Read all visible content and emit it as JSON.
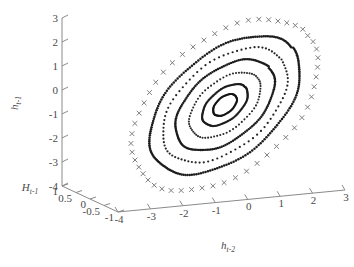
{
  "figure": {
    "kind": "3d-scatter-phase-portrait",
    "background": "#ffffff",
    "width": 354,
    "height": 267
  },
  "chart_data": {
    "type": "scatter",
    "title": "",
    "projection": "3d",
    "xlabel": "h_{t-2}",
    "ylabel": "h_{t-1}",
    "zlabel": "H_{t-1}",
    "xlabel_plain": "h",
    "xlabel_sub": "t-2",
    "ylabel_plain": "h",
    "ylabel_sub": "t-1",
    "zlabel_plain": "H",
    "zlabel_sub": "t-1",
    "grid": false,
    "legend": null,
    "xlim": [
      -4,
      3
    ],
    "ylim": [
      -4,
      3
    ],
    "zlim": [
      -1,
      1
    ],
    "xticks": [
      "-4",
      "-3",
      "-2",
      "-1",
      "0",
      "1",
      "2",
      "3"
    ],
    "xtick_values": [
      -4,
      -3,
      -2,
      -1,
      0,
      1,
      2,
      3
    ],
    "yticks": [
      "3",
      "2",
      "1",
      "0",
      "-1",
      "-2",
      "-3",
      "-4"
    ],
    "ytick_values": [
      3,
      2,
      1,
      0,
      -1,
      -2,
      -3,
      -4
    ],
    "zticks": [
      "1",
      "0.5",
      "0",
      "-0.5",
      "-1"
    ],
    "ztick_values": [
      1,
      0.5,
      0,
      -0.5,
      -1
    ],
    "center_px": [
      225,
      105
    ],
    "tilt_deg": -40,
    "series": [
      {
        "name": "outer-cross-orbit",
        "marker": "x",
        "color": "#7d7d7d",
        "marker_px": 4.2,
        "stroke_px": 1.0,
        "n_points": 52,
        "rx_px": 108,
        "ry_px": 66,
        "phase_deg": 0
      },
      {
        "name": "ring-1-dense",
        "marker": "dot",
        "color": "#1c1c1c",
        "marker_px": 2.5,
        "n_points": 200,
        "rx_px": 88,
        "ry_px": 52,
        "phase_deg": 0
      },
      {
        "name": "ring-2-dotted",
        "marker": "dot",
        "color": "#242424",
        "marker_px": 2.2,
        "n_points": 86,
        "rx_px": 73,
        "ry_px": 43,
        "phase_deg": 2
      },
      {
        "name": "ring-3-dense",
        "marker": "dot",
        "color": "#1c1c1c",
        "marker_px": 2.4,
        "n_points": 165,
        "rx_px": 58,
        "ry_px": 34,
        "phase_deg": 0
      },
      {
        "name": "ring-4-dotted",
        "marker": "dot",
        "color": "#2a2a2a",
        "marker_px": 2.1,
        "n_points": 70,
        "rx_px": 42,
        "ry_px": 24,
        "phase_deg": 5
      },
      {
        "name": "ring-5-dense",
        "marker": "dot",
        "color": "#1c1c1c",
        "marker_px": 2.3,
        "n_points": 120,
        "rx_px": 27,
        "ry_px": 15,
        "phase_deg": 0
      },
      {
        "name": "ring-6-inner-loop",
        "marker": "dot",
        "color": "#141414",
        "marker_px": 2.2,
        "n_points": 80,
        "rx_px": 14,
        "ry_px": 8,
        "phase_deg": 0
      }
    ]
  },
  "geometry": {
    "y_axis_top_px": [
      62,
      18
    ],
    "y_axis_bottom_px": [
      62,
      186
    ],
    "z_axis_top_px": [
      62,
      186
    ],
    "z_axis_bottom_px": [
      118,
      212
    ],
    "x_axis_left_px": [
      118,
      212
    ],
    "x_axis_right_px": [
      345,
      190
    ]
  }
}
